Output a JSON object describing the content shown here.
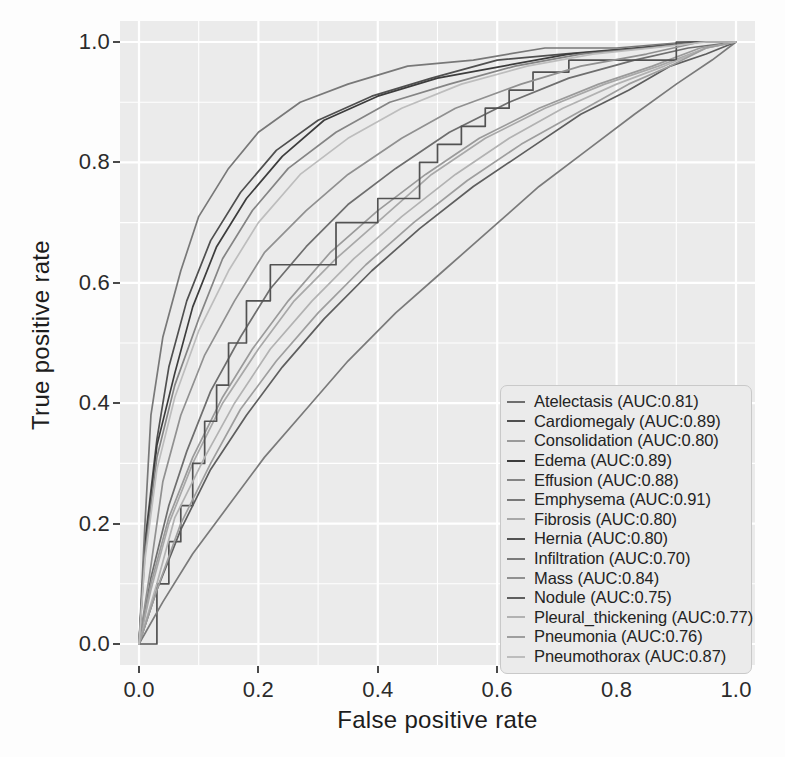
{
  "chart_data": {
    "type": "line",
    "title": "",
    "xlabel": "False positive rate",
    "ylabel": "True positive rate",
    "xlim": [
      0.0,
      1.0
    ],
    "ylim": [
      0.0,
      1.0
    ],
    "xticks": [
      "0.0",
      "0.2",
      "0.4",
      "0.6",
      "0.8",
      "1.0"
    ],
    "yticks": [
      "0.0",
      "0.2",
      "0.4",
      "0.6",
      "0.8",
      "1.0"
    ],
    "xtick_values": [
      0.0,
      0.2,
      0.4,
      0.6,
      0.8,
      1.0
    ],
    "ytick_values": [
      0.0,
      0.2,
      0.4,
      0.6,
      0.8,
      1.0
    ],
    "grid": true,
    "grid_color": "#ffffff",
    "panel_background": "#ebebeb",
    "legend_position": "bottom-right",
    "series": [
      {
        "name": "Atelectasis",
        "auc": 0.81,
        "label": "Atelectasis (AUC:0.81)",
        "color": "#6e6e6e",
        "x": [
          0.0,
          0.02,
          0.05,
          0.08,
          0.12,
          0.17,
          0.22,
          0.28,
          0.35,
          0.43,
          0.52,
          0.62,
          0.72,
          0.83,
          0.92,
          1.0
        ],
        "y": [
          0.0,
          0.11,
          0.23,
          0.32,
          0.42,
          0.51,
          0.59,
          0.66,
          0.73,
          0.79,
          0.85,
          0.9,
          0.94,
          0.97,
          0.99,
          1.0
        ]
      },
      {
        "name": "Cardiomegaly",
        "auc": 0.89,
        "label": "Cardiomegaly (AUC:0.89)",
        "color": "#4f4f4f",
        "x": [
          0.0,
          0.01,
          0.03,
          0.05,
          0.08,
          0.12,
          0.17,
          0.23,
          0.3,
          0.39,
          0.49,
          0.6,
          0.71,
          0.83,
          0.93,
          1.0
        ],
        "y": [
          0.0,
          0.17,
          0.34,
          0.46,
          0.57,
          0.67,
          0.75,
          0.82,
          0.87,
          0.91,
          0.94,
          0.97,
          0.98,
          0.99,
          1.0,
          1.0
        ]
      },
      {
        "name": "Consolidation",
        "auc": 0.8,
        "label": "Consolidation (AUC:0.80)",
        "color": "#9a9a9a",
        "x": [
          0.0,
          0.02,
          0.05,
          0.09,
          0.14,
          0.19,
          0.25,
          0.32,
          0.4,
          0.48,
          0.57,
          0.67,
          0.77,
          0.86,
          0.94,
          1.0
        ],
        "y": [
          0.0,
          0.1,
          0.21,
          0.31,
          0.41,
          0.49,
          0.57,
          0.65,
          0.72,
          0.78,
          0.84,
          0.89,
          0.93,
          0.96,
          0.99,
          1.0
        ]
      },
      {
        "name": "Edema",
        "auc": 0.89,
        "label": "Edema (AUC:0.89)",
        "color": "#3c3c3c",
        "x": [
          0.0,
          0.01,
          0.03,
          0.06,
          0.09,
          0.13,
          0.18,
          0.24,
          0.31,
          0.4,
          0.5,
          0.61,
          0.72,
          0.84,
          0.94,
          1.0
        ],
        "y": [
          0.0,
          0.16,
          0.33,
          0.45,
          0.56,
          0.66,
          0.74,
          0.81,
          0.87,
          0.91,
          0.94,
          0.96,
          0.98,
          0.99,
          1.0,
          1.0
        ]
      },
      {
        "name": "Effusion",
        "auc": 0.88,
        "label": "Effusion (AUC:0.88)",
        "color": "#848484",
        "x": [
          0.0,
          0.01,
          0.03,
          0.06,
          0.1,
          0.14,
          0.19,
          0.25,
          0.33,
          0.42,
          0.52,
          0.63,
          0.74,
          0.85,
          0.94,
          1.0
        ],
        "y": [
          0.0,
          0.15,
          0.31,
          0.43,
          0.54,
          0.64,
          0.72,
          0.79,
          0.85,
          0.9,
          0.93,
          0.96,
          0.98,
          0.99,
          1.0,
          1.0
        ]
      },
      {
        "name": "Emphysema",
        "auc": 0.91,
        "label": "Emphysema (AUC:0.91)",
        "color": "#787878",
        "x": [
          0.0,
          0.01,
          0.02,
          0.04,
          0.07,
          0.1,
          0.15,
          0.2,
          0.27,
          0.35,
          0.45,
          0.56,
          0.68,
          0.8,
          0.92,
          1.0
        ],
        "y": [
          0.0,
          0.2,
          0.38,
          0.51,
          0.62,
          0.71,
          0.79,
          0.85,
          0.9,
          0.93,
          0.96,
          0.97,
          0.99,
          0.99,
          1.0,
          1.0
        ]
      },
      {
        "name": "Fibrosis",
        "auc": 0.8,
        "label": "Fibrosis (AUC:0.80)",
        "color": "#a8a8a8",
        "x": [
          0.0,
          0.02,
          0.05,
          0.09,
          0.14,
          0.2,
          0.26,
          0.33,
          0.41,
          0.49,
          0.58,
          0.68,
          0.78,
          0.87,
          0.95,
          1.0
        ],
        "y": [
          0.0,
          0.09,
          0.2,
          0.3,
          0.4,
          0.49,
          0.57,
          0.64,
          0.71,
          0.78,
          0.84,
          0.89,
          0.93,
          0.96,
          0.99,
          1.0
        ]
      },
      {
        "name": "Hernia",
        "auc": 0.8,
        "label": "Hernia (AUC:0.80)",
        "color": "#525252",
        "x": [
          0.0,
          0.03,
          0.03,
          0.05,
          0.05,
          0.07,
          0.07,
          0.09,
          0.09,
          0.11,
          0.11,
          0.13,
          0.13,
          0.15,
          0.15,
          0.18,
          0.18,
          0.22,
          0.22,
          0.33,
          0.33,
          0.4,
          0.4,
          0.47,
          0.47,
          0.5,
          0.5,
          0.54,
          0.54,
          0.58,
          0.58,
          0.62,
          0.62,
          0.66,
          0.66,
          0.72,
          0.72,
          0.9,
          0.9,
          1.0
        ],
        "y": [
          0.0,
          0.0,
          0.1,
          0.1,
          0.17,
          0.17,
          0.23,
          0.23,
          0.3,
          0.3,
          0.37,
          0.37,
          0.43,
          0.43,
          0.5,
          0.5,
          0.57,
          0.57,
          0.63,
          0.63,
          0.7,
          0.7,
          0.74,
          0.74,
          0.8,
          0.8,
          0.83,
          0.83,
          0.86,
          0.86,
          0.89,
          0.89,
          0.92,
          0.92,
          0.95,
          0.95,
          0.97,
          0.97,
          1.0,
          1.0
        ]
      },
      {
        "name": "Infiltration",
        "auc": 0.7,
        "label": "Infiltration (AUC:0.70)",
        "color": "#7a7a7a",
        "x": [
          0.0,
          0.04,
          0.09,
          0.15,
          0.21,
          0.28,
          0.35,
          0.43,
          0.51,
          0.59,
          0.67,
          0.75,
          0.83,
          0.9,
          0.96,
          1.0
        ],
        "y": [
          0.0,
          0.07,
          0.15,
          0.23,
          0.31,
          0.39,
          0.47,
          0.55,
          0.62,
          0.69,
          0.76,
          0.82,
          0.88,
          0.93,
          0.97,
          1.0
        ]
      },
      {
        "name": "Mass",
        "auc": 0.84,
        "label": "Mass (AUC:0.84)",
        "color": "#909090",
        "x": [
          0.0,
          0.02,
          0.04,
          0.07,
          0.11,
          0.16,
          0.21,
          0.28,
          0.35,
          0.44,
          0.53,
          0.64,
          0.74,
          0.85,
          0.94,
          1.0
        ],
        "y": [
          0.0,
          0.13,
          0.27,
          0.38,
          0.48,
          0.57,
          0.65,
          0.72,
          0.78,
          0.84,
          0.89,
          0.93,
          0.96,
          0.98,
          1.0,
          1.0
        ]
      },
      {
        "name": "Nodule",
        "auc": 0.75,
        "label": "Nodule (AUC:0.75)",
        "color": "#5e5e5e",
        "x": [
          0.0,
          0.03,
          0.07,
          0.12,
          0.18,
          0.24,
          0.31,
          0.39,
          0.47,
          0.56,
          0.65,
          0.74,
          0.82,
          0.89,
          0.95,
          1.0
        ],
        "y": [
          0.0,
          0.09,
          0.19,
          0.29,
          0.38,
          0.46,
          0.54,
          0.62,
          0.69,
          0.76,
          0.82,
          0.88,
          0.92,
          0.96,
          0.98,
          1.0
        ]
      },
      {
        "name": "Pleural_thickening",
        "auc": 0.77,
        "label": "Pleural_thickening (AUC:0.77)",
        "color": "#b2b2b2",
        "x": [
          0.0,
          0.03,
          0.06,
          0.11,
          0.16,
          0.22,
          0.29,
          0.36,
          0.44,
          0.53,
          0.62,
          0.71,
          0.8,
          0.88,
          0.95,
          1.0
        ],
        "y": [
          0.0,
          0.1,
          0.21,
          0.31,
          0.4,
          0.49,
          0.57,
          0.64,
          0.71,
          0.78,
          0.84,
          0.89,
          0.93,
          0.96,
          0.99,
          1.0
        ]
      },
      {
        "name": "Pneumonia",
        "auc": 0.76,
        "label": "Pneumonia (AUC:0.76)",
        "color": "#9e9e9e",
        "x": [
          0.0,
          0.03,
          0.07,
          0.12,
          0.17,
          0.23,
          0.3,
          0.38,
          0.46,
          0.55,
          0.64,
          0.73,
          0.82,
          0.89,
          0.95,
          1.0
        ],
        "y": [
          0.0,
          0.09,
          0.2,
          0.3,
          0.39,
          0.47,
          0.55,
          0.63,
          0.7,
          0.77,
          0.83,
          0.88,
          0.93,
          0.96,
          0.99,
          1.0
        ]
      },
      {
        "name": "Pneumothorax",
        "auc": 0.87,
        "label": "Pneumothorax (AUC:0.87)",
        "color": "#bdbdbd",
        "x": [
          0.0,
          0.01,
          0.03,
          0.06,
          0.1,
          0.15,
          0.2,
          0.27,
          0.35,
          0.44,
          0.54,
          0.65,
          0.76,
          0.86,
          0.95,
          1.0
        ],
        "y": [
          0.0,
          0.14,
          0.29,
          0.41,
          0.52,
          0.62,
          0.7,
          0.78,
          0.84,
          0.89,
          0.93,
          0.96,
          0.98,
          0.99,
          1.0,
          1.0
        ]
      }
    ]
  }
}
